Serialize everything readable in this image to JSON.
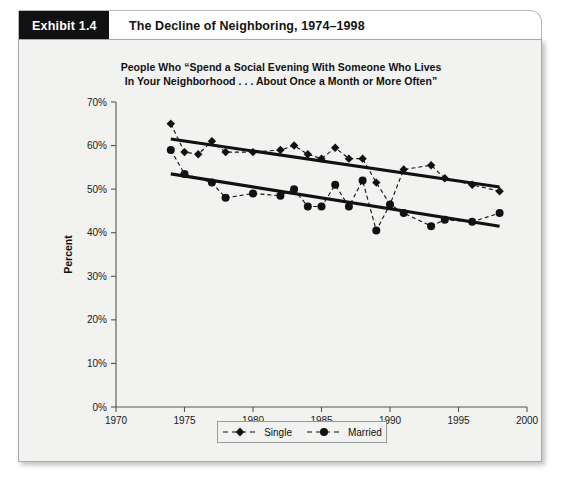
{
  "exhibit": {
    "tag": "Exhibit 1.4",
    "title": "The Decline of Neighboring, 1974–1998"
  },
  "chart_data": {
    "type": "line",
    "title_line1": "People Who “Spend a Social Evening With Someone Who Lives",
    "title_line2": "In Your Neighborhood . . . About Once a Month or More Often”",
    "xlabel": "",
    "ylabel": "Percent",
    "xlim": [
      1970,
      2000
    ],
    "ylim": [
      0,
      70
    ],
    "xticks": [
      1970,
      1975,
      1980,
      1985,
      1990,
      1995,
      2000
    ],
    "xticklabels": [
      "1970",
      "1975",
      "1980",
      "1985",
      "1990",
      "1995",
      "2000"
    ],
    "yticks": [
      0,
      10,
      20,
      30,
      40,
      50,
      60,
      70
    ],
    "yticklabels": [
      "0%",
      "10%",
      "20%",
      "30%",
      "40%",
      "50%",
      "60%",
      "70%"
    ],
    "grid": false,
    "legend_position": "below",
    "series": [
      {
        "name": "Single",
        "marker": "diamond",
        "linestyle": "dashed",
        "color": "#111111",
        "x": [
          1974,
          1975,
          1976,
          1977,
          1978,
          1980,
          1982,
          1983,
          1984,
          1985,
          1986,
          1987,
          1988,
          1989,
          1990,
          1991,
          1993,
          1994,
          1996,
          1998
        ],
        "y": [
          65.0,
          58.5,
          58.0,
          61.0,
          58.5,
          58.5,
          59.0,
          60.0,
          58.0,
          57.0,
          59.5,
          57.0,
          57.0,
          51.5,
          46.5,
          54.5,
          55.5,
          52.5,
          51.0,
          49.5
        ],
        "trend_start": [
          1974,
          61.5
        ],
        "trend_end": [
          1998,
          50.5
        ]
      },
      {
        "name": "Married",
        "marker": "circle",
        "linestyle": "dashed",
        "color": "#111111",
        "x": [
          1974,
          1975,
          1977,
          1978,
          1980,
          1982,
          1983,
          1984,
          1985,
          1986,
          1987,
          1988,
          1989,
          1990,
          1991,
          1993,
          1994,
          1996,
          1998
        ],
        "y": [
          59.0,
          53.5,
          51.5,
          48.0,
          49.0,
          48.5,
          50.0,
          46.0,
          46.0,
          51.0,
          46.0,
          52.0,
          40.5,
          46.5,
          44.5,
          41.5,
          43.0,
          42.5,
          44.5
        ],
        "trend_start": [
          1974,
          53.5
        ],
        "trend_end": [
          1998,
          41.5
        ]
      }
    ]
  },
  "legend": {
    "entries": [
      {
        "label": "Single",
        "marker": "diamond"
      },
      {
        "label": "Married",
        "marker": "circle"
      }
    ]
  }
}
